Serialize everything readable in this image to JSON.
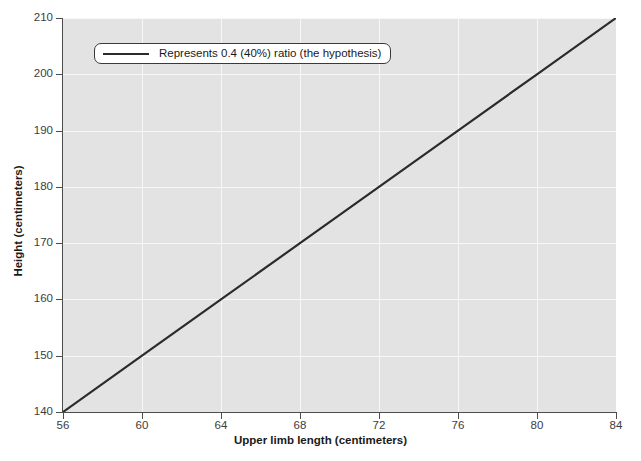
{
  "chart_data": {
    "type": "line",
    "title": "",
    "xlabel": "Upper limb length (centimeters)",
    "ylabel": "Height (centimeters)",
    "xlim": [
      56,
      84
    ],
    "ylim": [
      140,
      210
    ],
    "xticks": [
      56,
      60,
      64,
      68,
      72,
      76,
      80,
      84
    ],
    "yticks": [
      140,
      150,
      160,
      170,
      180,
      190,
      200,
      210
    ],
    "grid": true,
    "legend_position": "upper left",
    "series": [
      {
        "name": "Represents 0.4 (40%) ratio (the hypothesis)",
        "color": "#2b2b2b",
        "x": [
          56,
          60,
          64,
          68,
          72,
          76,
          80,
          84
        ],
        "values": [
          140,
          150,
          160,
          170,
          180,
          190,
          200,
          210
        ]
      }
    ],
    "annotations": []
  },
  "legend": {
    "entries": [
      {
        "label": "Represents 0.4 (40%) ratio (the hypothesis)"
      }
    ]
  },
  "colors": {
    "plot_background": "#e3e3e3",
    "grid": "#f7f7f7",
    "axis": "#4d4d4d",
    "line": "#2b2b2b",
    "text": "#1a1a1a",
    "figure_background": "#ffffff"
  }
}
